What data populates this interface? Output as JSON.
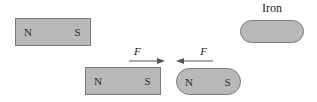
{
  "figure": {
    "background_color": "#ffffff",
    "magnet_fill_color": "#b9b9b9",
    "magnet_stroke_color": "#7a7a7a",
    "text_color": "#1a1a1a"
  },
  "labels": {
    "iron": "Iron",
    "north_pole": "N",
    "south_pole": "S",
    "force": "F"
  },
  "objects": [
    {
      "name": "magnet-top-left",
      "kind": "bar-magnet",
      "shape": "rectangle",
      "north_label": "N",
      "south_label": "S"
    },
    {
      "name": "iron-bar",
      "kind": "iron-bar",
      "shape": "rounded",
      "label": "Iron"
    },
    {
      "name": "magnet-bottom-left",
      "kind": "bar-magnet",
      "shape": "rectangle",
      "north_label": "N",
      "south_label": "S"
    },
    {
      "name": "magnet-bottom-right",
      "kind": "bar-magnet",
      "shape": "rounded",
      "north_label": "N",
      "south_label": "S"
    }
  ],
  "forces": [
    {
      "name": "force-left",
      "label": "F",
      "direction": "right"
    },
    {
      "name": "force-right",
      "label": "F",
      "direction": "left"
    }
  ]
}
